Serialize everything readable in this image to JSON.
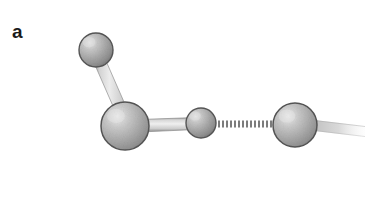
{
  "figure": {
    "panel_label": "a",
    "background_color": "#ffffff",
    "width": 365,
    "height": 206,
    "description_kind": "ball-and-stick molecular model"
  },
  "palette": {
    "sphere_highlight": "#e8e8e8",
    "sphere_mid": "#b0b0b0",
    "sphere_base": "#9a9a9a",
    "sphere_shadow": "#7a7a7a",
    "sphere_outline": "#5e5e5e",
    "bond_fill_light": "#e4e4e4",
    "bond_fill_mid": "#c9c9c9",
    "bond_edge": "#8d8d8d",
    "hbond_dash": "#7c7c7c",
    "label_color": "#1a1a1a"
  },
  "atoms": [
    {
      "id": "atom-top-left",
      "name": "hydrogen-upper",
      "cx": 96,
      "cy": 50,
      "r": 17,
      "highlight_x": 89,
      "highlight_y": 42
    },
    {
      "id": "atom-center",
      "name": "oxygen-donor",
      "cx": 125,
      "cy": 126,
      "r": 24,
      "highlight_x": 116,
      "highlight_y": 116
    },
    {
      "id": "atom-small-middle",
      "name": "hydrogen-bridging",
      "cx": 201,
      "cy": 123,
      "r": 15,
      "highlight_x": 195,
      "highlight_y": 116
    },
    {
      "id": "atom-right",
      "name": "oxygen-acceptor",
      "cx": 295,
      "cy": 125,
      "r": 22,
      "highlight_x": 287,
      "highlight_y": 116
    }
  ],
  "bonds": [
    {
      "id": "bond-upper-left",
      "name": "covalent-bond-upper",
      "x1": 99,
      "y1": 64,
      "x2": 122,
      "y2": 116,
      "width": 11,
      "style": "cylinder"
    },
    {
      "id": "bond-horizontal",
      "name": "covalent-bond-horizontal",
      "x1": 144,
      "y1": 126,
      "x2": 192,
      "y2": 124,
      "width": 12,
      "style": "cylinder"
    },
    {
      "id": "bond-right-tail",
      "name": "covalent-bond-tail",
      "x1": 312,
      "y1": 123,
      "x2": 362,
      "y2": 131,
      "width": 11,
      "style": "cylinder-fading"
    }
  ],
  "hydrogen_bond": {
    "id": "hbond-dotted",
    "name": "hydrogen-bond-dotted",
    "x1": 218,
    "y1": 124,
    "x2": 272,
    "y2": 124,
    "dash_count": 13,
    "dash_length": 2,
    "dash_gap": 2,
    "thickness": 7
  }
}
